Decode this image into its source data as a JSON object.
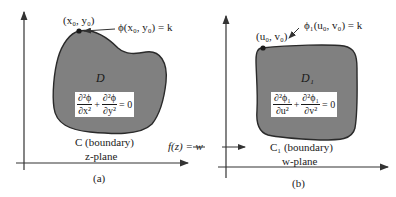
{
  "colors": {
    "region_fill": "#808080",
    "outline": "#2a2a2a",
    "axis": "#333333",
    "background": "#ffffff"
  },
  "panel_a": {
    "point_label": "(x₀, y₀)",
    "point_eq": "ϕ(x₀, y₀) = k",
    "region_label": "D",
    "laplace": {
      "term1_num": "∂²ϕ",
      "term1_den": "∂x²",
      "plus": "+",
      "term2_num": "∂²ϕ",
      "term2_den": "∂y²",
      "rhs": "= 0"
    },
    "boundary_label": "C (boundary)",
    "plane_label": "z-plane",
    "caption": "(a)"
  },
  "mapping": {
    "label": "f(z) = w"
  },
  "panel_b": {
    "point_label": "(u₀, v₀)",
    "point_eq": "ϕ₁(u₀, v₀) = k",
    "region_label": "D₁",
    "laplace": {
      "term1_num": "∂²ϕ₁",
      "term1_den": "∂u²",
      "plus": "+",
      "term2_num": "∂²ϕ₁",
      "term2_den": "∂v²",
      "rhs": "= 0"
    },
    "boundary_label": "C₁ (boundary)",
    "plane_label": "w-plane",
    "caption": "(b)"
  }
}
